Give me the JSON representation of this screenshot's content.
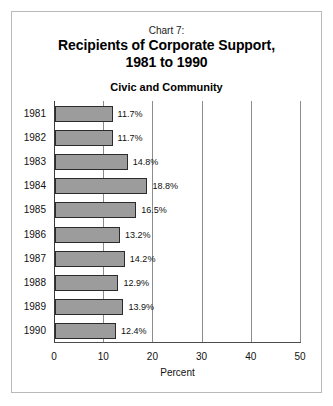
{
  "chart_data": {
    "type": "bar",
    "orientation": "horizontal",
    "chart_number": "Chart 7:",
    "title": "Recipients of Corporate Support,",
    "title_line2": "1981 to 1990",
    "subtitle": "Civic and Community",
    "xlabel": "Percent",
    "ylabel": "",
    "xlim": [
      0,
      50
    ],
    "xticks": [
      0,
      10,
      20,
      30,
      40,
      50
    ],
    "xtick_labels": [
      "0",
      "10",
      "20",
      "30",
      "40",
      "50"
    ],
    "grid": true,
    "legend": false,
    "categories": [
      "1981",
      "1982",
      "1983",
      "1984",
      "1985",
      "1986",
      "1987",
      "1988",
      "1989",
      "1990"
    ],
    "values": [
      11.7,
      11.7,
      14.8,
      18.8,
      16.5,
      13.2,
      14.2,
      12.9,
      13.9,
      12.4
    ],
    "value_labels": [
      "11.7%",
      "11.7%",
      "14.8%",
      "18.8%",
      "16.5%",
      "13.2%",
      "14.2%",
      "12.9%",
      "13.9%",
      "12.4%"
    ],
    "bar_color": "#9c9c9c",
    "bar_edge_color": "#2b2b2b",
    "background_color": "#ffffff",
    "frame_color": "#b9b9b9"
  }
}
